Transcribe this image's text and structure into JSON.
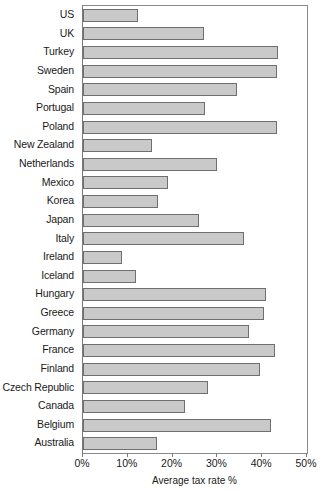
{
  "chart_data": {
    "type": "bar",
    "orientation": "horizontal",
    "title": "",
    "xlabel": "Average tax rate %",
    "ylabel": "",
    "xlim": [
      0,
      50
    ],
    "xticks": [
      0,
      10,
      20,
      30,
      40,
      50
    ],
    "xtick_labels": [
      "0%",
      "10%",
      "20%",
      "30%",
      "40%",
      "50%"
    ],
    "grid": false,
    "legend": null,
    "bar_color": "#c9c9c9",
    "bar_edge_color": "#6f6f6f",
    "categories": [
      "US",
      "UK",
      "Turkey",
      "Sweden",
      "Spain",
      "Portugal",
      "Poland",
      "New Zealand",
      "Netherlands",
      "Mexico",
      "Korea",
      "Japan",
      "Italy",
      "Ireland",
      "Iceland",
      "Hungary",
      "Greece",
      "Germany",
      "France",
      "Finland",
      "Czech Republic",
      "Canada",
      "Belgium",
      "Australia"
    ],
    "values": [
      12.3,
      27.0,
      43.5,
      43.4,
      34.4,
      27.2,
      43.4,
      15.4,
      30.0,
      19.0,
      16.7,
      26.0,
      36.0,
      8.7,
      11.8,
      40.8,
      40.4,
      37.0,
      42.9,
      39.5,
      28.0,
      22.8,
      42.0,
      16.6
    ]
  }
}
